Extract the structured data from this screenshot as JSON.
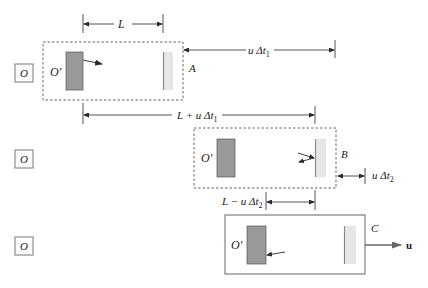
{
  "diagram": {
    "observer_label": "O",
    "moving_frame_label": "O′",
    "velocity_label": "u⃗",
    "colors": {
      "line": "#2a2a2a",
      "source_fill": "#999999",
      "mirror_edge": "#8c8c8c",
      "mirror_fill": "#e6e6e6",
      "box_dash": "#555555"
    },
    "panels": [
      {
        "id": "A",
        "label": "A",
        "style": "dashed",
        "pulse": "right"
      },
      {
        "id": "B",
        "label": "B",
        "style": "dashed",
        "pulse": "reflect"
      },
      {
        "id": "C",
        "label": "C",
        "style": "solid",
        "pulse": "left"
      }
    ],
    "dimensions": {
      "L": "L",
      "u_dt1": "u Δt",
      "u_dt1_sub": "1",
      "L_plus": "L + u Δt",
      "L_plus_sub": "1",
      "u_dt2": "u Δt",
      "u_dt2_sub": "2",
      "L_minus": "L − u Δt",
      "L_minus_sub": "2"
    }
  }
}
